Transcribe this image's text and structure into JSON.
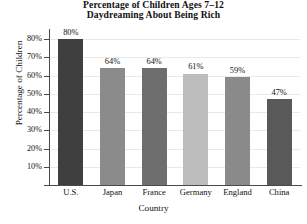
{
  "chart_data": {
    "type": "bar",
    "title": "Percentage of Children Ages 7–12 Daydreaming About Being Rich",
    "title_lines": [
      "Percentage of Children Ages 7–12",
      "Daydreaming About Being Rich"
    ],
    "xlabel": "Country",
    "ylabel": "Percentage of Children",
    "categories": [
      "U.S.",
      "Japan",
      "France",
      "Germany",
      "England",
      "China"
    ],
    "values": [
      80,
      64,
      64,
      61,
      59,
      47
    ],
    "value_labels": [
      "80%",
      "64%",
      "64%",
      "61%",
      "59%",
      "47%"
    ],
    "ylim": [
      0,
      85
    ],
    "yticks": [
      10,
      20,
      30,
      40,
      50,
      60,
      70,
      80
    ],
    "ytick_labels": [
      "10%",
      "20%",
      "30%",
      "40%",
      "50%",
      "60%",
      "70%",
      "80%"
    ],
    "grid": true,
    "legend": false,
    "bar_colors": [
      "#3f3f3f",
      "#8b8b8b",
      "#6e6e6e",
      "#bcbcbc",
      "#8a8a8a",
      "#595959"
    ],
    "grid_color": "#e9e9e9",
    "axis_color": "#4a4a4a"
  }
}
